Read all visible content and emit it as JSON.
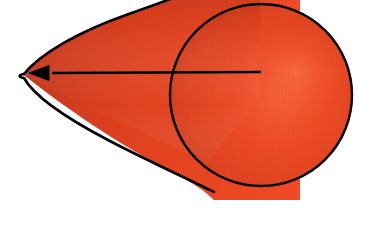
{
  "figure": {
    "title": "Red cone with leftward axis arrow",
    "background_color": "#ffffff",
    "canvas": {
      "width": 378,
      "height": 225
    }
  },
  "colors": {
    "fill_bright": "#ee4422",
    "fill_mid": "#e0411f",
    "fill_dark": "#b83418",
    "fill_shadow": "#9e2d14",
    "highlight": "#f4663c",
    "outline": "#000000",
    "arrow": "#000000"
  },
  "geometry": {
    "apex": {
      "x": 24,
      "y": 75,
      "label": "cone-apex"
    },
    "base_circle": {
      "cx": 261,
      "cy": 95,
      "r": 91,
      "label": "cone-base-circle"
    },
    "upper_tangent_exit": {
      "x": 212,
      "y": 0
    },
    "lower_tangent_exit": {
      "x": 207,
      "y": 163
    },
    "arrow": {
      "start": {
        "x": 261,
        "y": 72
      },
      "end": {
        "x": 29,
        "y": 73
      },
      "head_length": 20,
      "head_width": 15,
      "direction": "left",
      "stroke_width": 2.6
    }
  },
  "elements": {
    "cone_body_name": "cone-body",
    "base_circle_name": "cone-base-circle",
    "axis_arrow_name": "axis-arrow",
    "apex_name": "cone-apex"
  }
}
